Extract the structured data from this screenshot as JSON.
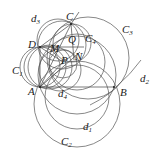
{
  "diagram": {
    "type": "geometry-figure",
    "points": [
      {
        "name": "A",
        "x": 40,
        "y": 87
      },
      {
        "name": "B",
        "x": 114,
        "y": 87
      },
      {
        "name": "C",
        "x": 71,
        "y": 24
      },
      {
        "name": "D",
        "x": 40,
        "y": 47
      },
      {
        "name": "M",
        "x": 55,
        "y": 52
      },
      {
        "name": "Q",
        "x": 70,
        "y": 42
      },
      {
        "name": "N",
        "x": 76,
        "y": 57
      },
      {
        "name": "P",
        "x": 63,
        "y": 62
      }
    ],
    "labels": {
      "A": "A",
      "B": "B",
      "C": "C",
      "D": "D",
      "M": "M",
      "Q": "Q",
      "N": "N",
      "P": "P",
      "C1": "C",
      "C1_sub": "1",
      "C2": "C",
      "C2_sub": "2",
      "C3": "C",
      "C3_sub": "3",
      "C4": "C",
      "C4_sub": "4",
      "d1": "d",
      "d1_sub": "1",
      "d2": "d",
      "d2_sub": "2",
      "d3": "d",
      "d3_sub": "3",
      "d4": "d",
      "d4_sub": "4"
    },
    "curves": [
      "C1",
      "C2",
      "C3",
      "C4",
      "d1",
      "d2",
      "d3",
      "d4"
    ],
    "colors": {
      "stroke": "#555555",
      "background": "#ffffff"
    }
  }
}
